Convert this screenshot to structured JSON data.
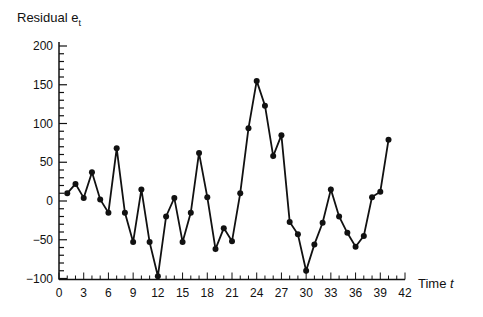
{
  "chart_data": {
    "type": "line",
    "title": "",
    "ylabel": "Residual e",
    "ylabel_subscript": "t",
    "xlabel": "Time",
    "xlabel_var": "t",
    "xlim": [
      0,
      42
    ],
    "ylim": [
      -100,
      200
    ],
    "x_ticks": [
      0,
      3,
      6,
      9,
      12,
      15,
      18,
      21,
      24,
      27,
      30,
      33,
      36,
      39,
      42
    ],
    "y_ticks": [
      -100,
      -50,
      0,
      50,
      100,
      150,
      200
    ],
    "y_tick_labels": [
      "−100",
      "−50",
      "0",
      "50",
      "100",
      "150",
      "200"
    ],
    "grid": false,
    "markers": true,
    "series": [
      {
        "name": "Residual",
        "x": [
          1,
          2,
          3,
          4,
          5,
          6,
          7,
          8,
          9,
          10,
          11,
          12,
          13,
          14,
          15,
          16,
          17,
          18,
          19,
          20,
          21,
          22,
          23,
          24,
          25,
          26,
          27,
          28,
          29,
          30,
          31,
          32,
          33,
          34,
          35,
          36,
          37,
          38,
          39,
          40
        ],
        "values": [
          10,
          22,
          4,
          37,
          2,
          -15,
          68,
          -15,
          -53,
          15,
          -53,
          -97,
          -20,
          4,
          -53,
          -15,
          62,
          5,
          -62,
          -35,
          -52,
          10,
          94,
          155,
          123,
          58,
          85,
          -27,
          -43,
          -90,
          -56,
          -28,
          15,
          -20,
          -41,
          -59,
          -45,
          5,
          12,
          79
        ]
      }
    ]
  },
  "colors": {
    "line": "#111111",
    "axis": "#111111",
    "background": "#ffffff"
  }
}
